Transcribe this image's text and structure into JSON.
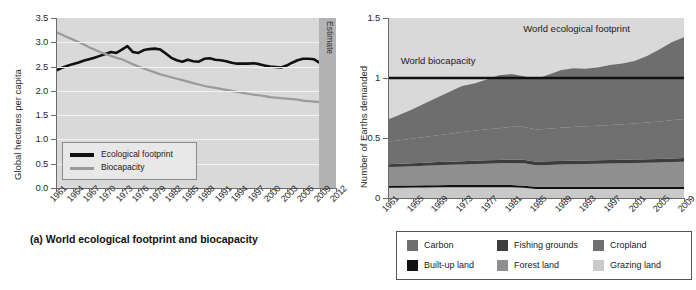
{
  "figure": {
    "caption_a": "(a) World ecological footprint and biocapacity"
  },
  "chart_data": [
    {
      "id": "chart-a",
      "type": "line",
      "title": "(a) World ecological footprint and biocapacity",
      "xlabel": "",
      "ylabel": "Global hectares per capita",
      "ylim": [
        0.0,
        3.5
      ],
      "xlim": [
        1961,
        2012
      ],
      "grid": true,
      "legend_position": "lower-left-inside",
      "ytick_labels": [
        "0.0",
        "0.5",
        "1.0",
        "1.5",
        "2.0",
        "2.5",
        "3.0",
        "3.5"
      ],
      "ytick_values": [
        0.0,
        0.5,
        1.0,
        1.5,
        2.0,
        2.5,
        3.0,
        3.5
      ],
      "xtick_labels": [
        "1961",
        "1964",
        "1967",
        "1970",
        "1973",
        "1976",
        "1979",
        "1982",
        "1985",
        "1988",
        "1991",
        "1994",
        "1997",
        "2000",
        "2003",
        "2006",
        "2009",
        "2012"
      ],
      "xtick_values": [
        1961,
        1964,
        1967,
        1970,
        1973,
        1976,
        1979,
        1982,
        1985,
        1988,
        1991,
        1994,
        1997,
        2000,
        2003,
        2006,
        2009,
        2012
      ],
      "annotations": [
        {
          "text": "Estimate",
          "from_year": 2009,
          "to_year": 2012,
          "orientation": "vertical"
        }
      ],
      "x": [
        1961,
        1962,
        1963,
        1964,
        1965,
        1966,
        1967,
        1968,
        1969,
        1970,
        1971,
        1972,
        1973,
        1974,
        1975,
        1976,
        1977,
        1978,
        1979,
        1980,
        1981,
        1982,
        1983,
        1984,
        1985,
        1986,
        1987,
        1988,
        1989,
        1990,
        1991,
        1992,
        1993,
        1994,
        1995,
        1996,
        1997,
        1998,
        1999,
        2000,
        2001,
        2002,
        2003,
        2004,
        2005,
        2006,
        2007,
        2008,
        2009,
        2010,
        2011,
        2012
      ],
      "series": [
        {
          "name": "Ecological footprint",
          "color": "#111111",
          "values": [
            2.42,
            2.47,
            2.51,
            2.55,
            2.58,
            2.62,
            2.65,
            2.68,
            2.72,
            2.76,
            2.8,
            2.78,
            2.85,
            2.92,
            2.8,
            2.78,
            2.84,
            2.86,
            2.87,
            2.85,
            2.77,
            2.68,
            2.63,
            2.6,
            2.64,
            2.61,
            2.6,
            2.66,
            2.67,
            2.64,
            2.63,
            2.61,
            2.58,
            2.56,
            2.56,
            2.56,
            2.57,
            2.55,
            2.52,
            2.5,
            2.49,
            2.48,
            2.52,
            2.58,
            2.63,
            2.66,
            2.66,
            2.65,
            2.58,
            2.58,
            2.58,
            2.58
          ]
        },
        {
          "name": "Biocapacity",
          "color": "#9a9a9a",
          "values": [
            3.21,
            3.16,
            3.11,
            3.06,
            3.01,
            2.96,
            2.9,
            2.85,
            2.8,
            2.76,
            2.72,
            2.68,
            2.65,
            2.6,
            2.55,
            2.5,
            2.46,
            2.42,
            2.38,
            2.34,
            2.31,
            2.28,
            2.25,
            2.22,
            2.19,
            2.16,
            2.13,
            2.1,
            2.08,
            2.06,
            2.04,
            2.02,
            2.0,
            1.98,
            1.96,
            1.94,
            1.92,
            1.91,
            1.89,
            1.87,
            1.86,
            1.85,
            1.84,
            1.83,
            1.82,
            1.8,
            1.79,
            1.78,
            1.77,
            1.76,
            1.76,
            1.75
          ]
        }
      ],
      "legend": [
        {
          "label": "Ecological footprint",
          "color": "#111111"
        },
        {
          "label": "Biocapacity",
          "color": "#9a9a9a"
        }
      ]
    },
    {
      "id": "chart-b",
      "type": "area",
      "title": "",
      "xlabel": "",
      "ylabel": "Number of Earths demanded",
      "ylim": [
        0,
        1.5
      ],
      "xlim": [
        1961,
        2009
      ],
      "grid": false,
      "legend_position": "below",
      "ytick_labels": [
        "0",
        "0.5",
        "1",
        "1.5"
      ],
      "ytick_values": [
        0,
        0.5,
        1,
        1.5
      ],
      "xtick_labels": [
        "1961",
        "1965",
        "1969",
        "1973",
        "1977",
        "1981",
        "1985",
        "1989",
        "1993",
        "1997",
        "2001",
        "2005",
        "2009"
      ],
      "xtick_values": [
        1961,
        1965,
        1969,
        1973,
        1977,
        1981,
        1985,
        1989,
        1993,
        1997,
        2001,
        2005,
        2009
      ],
      "annotations": [
        {
          "text": "World ecological footprint",
          "x": 1993,
          "y": 1.4
        },
        {
          "text": "World biocapacity",
          "x": 1965,
          "y": 1.13
        }
      ],
      "reference_line": {
        "label": "World biocapacity",
        "value": 1.0,
        "color": "#111111"
      },
      "x": [
        1961,
        1963,
        1965,
        1967,
        1969,
        1971,
        1973,
        1975,
        1977,
        1979,
        1981,
        1983,
        1985,
        1987,
        1989,
        1991,
        1993,
        1995,
        1997,
        1999,
        2001,
        2003,
        2005,
        2007,
        2009
      ],
      "stack_order_bottom_to_top": [
        "Grazing land",
        "Built-up land",
        "Forest land",
        "Fishing grounds",
        "Cropland",
        "Carbon"
      ],
      "series": [
        {
          "name": "Grazing land",
          "color": "#c9c9c9",
          "values": [
            0.085,
            0.086,
            0.087,
            0.088,
            0.089,
            0.09,
            0.09,
            0.09,
            0.09,
            0.09,
            0.09,
            0.085,
            0.075,
            0.075,
            0.075,
            0.075,
            0.075,
            0.075,
            0.075,
            0.075,
            0.075,
            0.075,
            0.075,
            0.075,
            0.075
          ]
        },
        {
          "name": "Built-up land",
          "color": "#111111",
          "values": [
            0.018,
            0.018,
            0.018,
            0.018,
            0.018,
            0.018,
            0.018,
            0.018,
            0.018,
            0.018,
            0.018,
            0.018,
            0.018,
            0.018,
            0.018,
            0.018,
            0.018,
            0.018,
            0.018,
            0.018,
            0.018,
            0.018,
            0.018,
            0.018,
            0.018
          ]
        },
        {
          "name": "Forest land",
          "color": "#8f8f8f",
          "values": [
            0.155,
            0.157,
            0.16,
            0.163,
            0.166,
            0.169,
            0.172,
            0.175,
            0.178,
            0.181,
            0.184,
            0.186,
            0.18,
            0.183,
            0.186,
            0.188,
            0.19,
            0.192,
            0.194,
            0.196,
            0.198,
            0.2,
            0.203,
            0.206,
            0.21
          ]
        },
        {
          "name": "Fishing grounds",
          "color": "#3d3d3d",
          "values": [
            0.024,
            0.024,
            0.025,
            0.025,
            0.026,
            0.026,
            0.027,
            0.027,
            0.028,
            0.028,
            0.029,
            0.029,
            0.03,
            0.03,
            0.03,
            0.03,
            0.03,
            0.03,
            0.03,
            0.03,
            0.03,
            0.03,
            0.03,
            0.03,
            0.03
          ]
        },
        {
          "name": "Cropland",
          "color": "#707070",
          "values": [
            0.188,
            0.196,
            0.205,
            0.215,
            0.224,
            0.233,
            0.242,
            0.25,
            0.258,
            0.265,
            0.272,
            0.276,
            0.268,
            0.272,
            0.276,
            0.28,
            0.284,
            0.288,
            0.292,
            0.296,
            0.3,
            0.306,
            0.312,
            0.318,
            0.326
          ]
        },
        {
          "name": "Carbon",
          "color": "#6e6e6e",
          "values": [
            0.185,
            0.215,
            0.245,
            0.28,
            0.315,
            0.35,
            0.385,
            0.395,
            0.415,
            0.44,
            0.44,
            0.42,
            0.42,
            0.45,
            0.48,
            0.49,
            0.48,
            0.485,
            0.5,
            0.505,
            0.52,
            0.555,
            0.6,
            0.65,
            0.68
          ]
        }
      ],
      "legend": [
        {
          "label": "Carbon",
          "color": "#6e6e6e"
        },
        {
          "label": "Fishing grounds",
          "color": "#3d3d3d"
        },
        {
          "label": "Cropland",
          "color": "#707070"
        },
        {
          "label": "Built-up land",
          "color": "#111111"
        },
        {
          "label": "Forest land",
          "color": "#8f8f8f"
        },
        {
          "label": "Grazing land",
          "color": "#c9c9c9"
        }
      ]
    }
  ]
}
